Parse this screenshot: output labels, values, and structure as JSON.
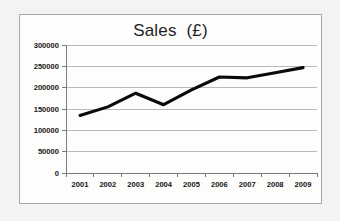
{
  "chart_data": {
    "type": "line",
    "title": "Sales  (£)",
    "xlabel": "",
    "ylabel": "",
    "categories": [
      "2001",
      "2002",
      "2003",
      "2004",
      "2005",
      "2006",
      "2007",
      "2008",
      "2009"
    ],
    "values": [
      135000,
      155000,
      187000,
      160000,
      195000,
      225000,
      223000,
      235000,
      247000
    ],
    "series": [
      {
        "name": "Sales",
        "values": [
          135000,
          155000,
          187000,
          160000,
          195000,
          225000,
          223000,
          235000,
          247000
        ]
      }
    ],
    "ylim": [
      0,
      300000
    ],
    "y_ticks": [
      0,
      50000,
      100000,
      150000,
      200000,
      250000,
      300000
    ],
    "y_tick_labels": [
      "0",
      "50000",
      "100000",
      "150000",
      "200000",
      "250000",
      "300000"
    ],
    "x_tick_labels": [
      "2001",
      "2002",
      "2003",
      "2004",
      "2005",
      "2006",
      "2007",
      "2008",
      "2009"
    ],
    "grid": true,
    "grid_axis": "y",
    "legend": false,
    "legend_position": "none",
    "line_color": "#0a0a0a",
    "grid_color": "#b9b9b9",
    "axis_color": "#7a7a7a",
    "plot_background": "#fdfdfc",
    "page_background": "#f4f3f1"
  }
}
